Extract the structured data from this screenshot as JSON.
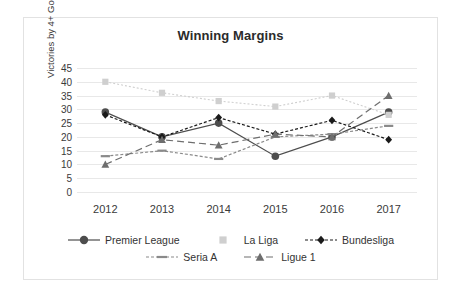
{
  "chart_data": {
    "type": "line",
    "title": "Winning Margins",
    "xlabel": "",
    "ylabel": "Victories by 4+ Goals",
    "categories": [
      "2012",
      "2013",
      "2014",
      "2015",
      "2016",
      "2017"
    ],
    "ylim": [
      0,
      45
    ],
    "ytick_step": 5,
    "yticks": [
      "45",
      "40",
      "35",
      "30",
      "25",
      "20",
      "15",
      "10",
      "5",
      "0"
    ],
    "grid": true,
    "legend_position": "bottom",
    "series": [
      {
        "name": "Premier League",
        "marker": "circle",
        "line": "solid",
        "color": "#4d4d4d",
        "values": [
          29,
          20,
          25,
          13,
          20,
          29
        ]
      },
      {
        "name": "La Liga",
        "marker": "square",
        "line": "dotted-light",
        "color": "#cfcfcf",
        "values": [
          40,
          36,
          33,
          31,
          35,
          28
        ]
      },
      {
        "name": "Bundesliga",
        "marker": "diamond",
        "line": "dashed",
        "color": "#1a1a1a",
        "values": [
          28,
          20,
          27,
          21,
          26,
          19
        ]
      },
      {
        "name": "Seria A",
        "marker": "dash",
        "line": "dashed",
        "color": "#8a8a8a",
        "values": [
          13,
          15,
          12,
          20,
          21,
          24
        ]
      },
      {
        "name": "Ligue 1",
        "marker": "triangle",
        "line": "long-dashed",
        "color": "#6e6e6e",
        "values": [
          10,
          19,
          17,
          21,
          20,
          35
        ]
      }
    ]
  },
  "legend": {
    "rows": [
      [
        "Premier League",
        "La Liga",
        "Bundesliga"
      ],
      [
        "Seria A",
        "Ligue 1"
      ]
    ]
  }
}
